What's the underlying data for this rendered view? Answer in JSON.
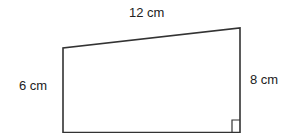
{
  "diagram": {
    "shape": "trapezium",
    "labels": {
      "top": "12 cm",
      "left": "6 cm",
      "right": "8 cm"
    },
    "right_angle_marker": "bottom-right",
    "stroke_color": "#333333"
  }
}
